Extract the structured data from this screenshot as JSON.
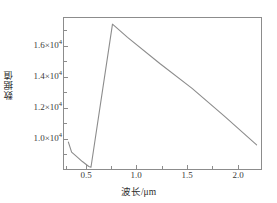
{
  "chart_data": {
    "type": "line",
    "title": "",
    "subtitle": "",
    "xlabel": "波长/μm",
    "ylabel": "数据值",
    "xlim": [
      0.4,
      2.25
    ],
    "ylim": [
      8300,
      17900
    ],
    "grid": false,
    "legend": null,
    "line_color": "#8c8c8c",
    "axis_color": "#8c8c8c",
    "x_ticks": [
      0.5,
      1.0,
      1.5,
      2.0
    ],
    "x_tick_labels": [
      "0.5",
      "1.0",
      "1.5",
      "2.0"
    ],
    "y_ticks": [
      10000,
      12000,
      14000,
      16000
    ],
    "y_tick_labels": [
      "1.0×10",
      "1.2×10",
      "1.4×10",
      "1.6×10"
    ],
    "y_tick_exponent": "4",
    "series": [
      {
        "name": "数据值",
        "x": [
          0.45,
          0.48,
          0.52,
          0.58,
          0.64,
          0.66,
          0.86,
          1.0,
          1.3,
          1.6,
          1.9,
          2.2
        ],
        "values": [
          10050,
          9420,
          9190,
          8830,
          8520,
          8470,
          17450,
          16620,
          14980,
          13420,
          11680,
          9880
        ]
      }
    ],
    "annotations": []
  },
  "axes": {
    "y_labels": [
      {
        "text": "1.6×10",
        "sup": "4",
        "top": 41
      },
      {
        "text": "1.4×10",
        "sup": "4",
        "top": 72
      },
      {
        "text": "1.2×10",
        "sup": "4",
        "top": 103
      },
      {
        "text": "1.0×10",
        "sup": "4",
        "top": 134
      }
    ],
    "x_labels": [
      {
        "text": "0.5",
        "left": 73
      },
      {
        "text": "1.0",
        "left": 123
      },
      {
        "text": "1.5",
        "left": 174
      },
      {
        "text": "2.0",
        "left": 225
      }
    ]
  },
  "caption": ""
}
